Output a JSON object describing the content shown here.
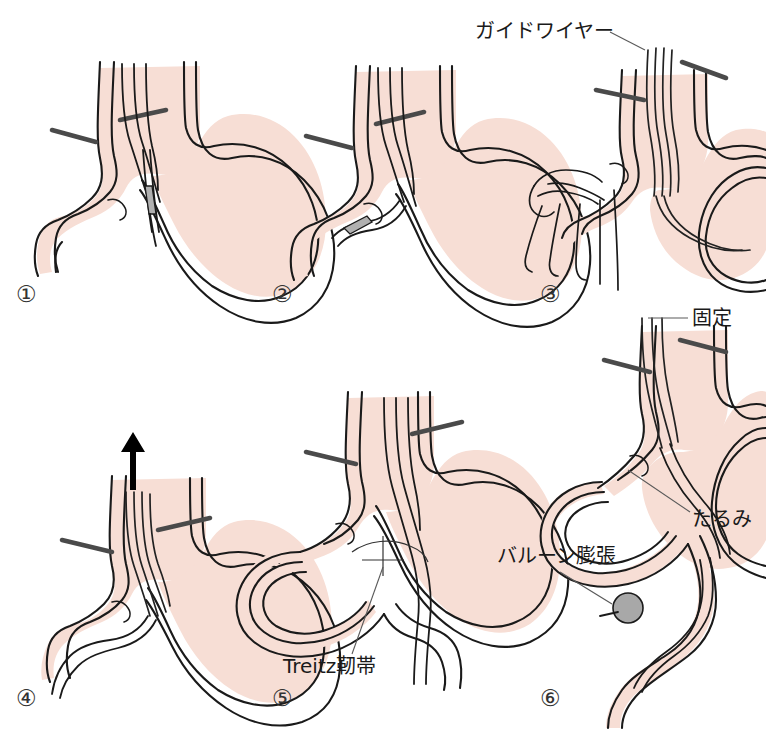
{
  "figure": {
    "background_color": "#ffffff",
    "organ_fill_color": "#f7ded5",
    "outline_color": "#1a1a1a",
    "balloon_color": "#a8a8a8",
    "scope_color": "#4a4a4a"
  },
  "panels": [
    {
      "id": "panel-1",
      "number": "①",
      "number_x": 16,
      "number_y": 302,
      "description": "内視鏡を胃内に挿入しカテーテル先端を確認"
    },
    {
      "id": "panel-2",
      "number": "②",
      "number_x": 272,
      "number_y": 302,
      "description": "ガイドワイヤーを十二指腸へ進める"
    },
    {
      "id": "panel-3",
      "number": "③",
      "number_x": 540,
      "number_y": 302,
      "description": "ガイドワイヤーを把持して内視鏡を抜去"
    },
    {
      "id": "panel-4",
      "number": "④",
      "number_x": 16,
      "number_y": 706,
      "description": "内視鏡を引き抜く"
    },
    {
      "id": "panel-5",
      "number": "⑤",
      "number_x": 272,
      "number_y": 706,
      "description": "イレウス管をTreitz靭帯を越えて進める"
    },
    {
      "id": "panel-6",
      "number": "⑥",
      "number_x": 540,
      "number_y": 706,
      "description": "バルーンを膨張させ固定、たるみを持たせる"
    }
  ],
  "annotations": [
    {
      "id": "guidewire",
      "label": "ガイドワイヤー",
      "text_x": 475,
      "text_y": 38,
      "anchor": "start",
      "leader": "M 610 32 L 645 50"
    },
    {
      "id": "fixation",
      "label": "固定",
      "text_x": 692,
      "text_y": 325,
      "anchor": "start",
      "leader": "M 688 318 L 648 318"
    },
    {
      "id": "slack",
      "label": "たるみ",
      "text_x": 692,
      "text_y": 526,
      "anchor": "start",
      "leader": "M 690 512 L 628 470"
    },
    {
      "id": "balloon-inflation",
      "label": "バルーン膨張",
      "text_x": 497,
      "text_y": 563,
      "anchor": "start",
      "leader": "M 560 572 L 612 604"
    },
    {
      "id": "treitz-ligament",
      "label": "Treitz靭帯",
      "text_x": 283,
      "text_y": 673,
      "anchor": "start",
      "leader": "M 352 654 L 383 567"
    }
  ]
}
